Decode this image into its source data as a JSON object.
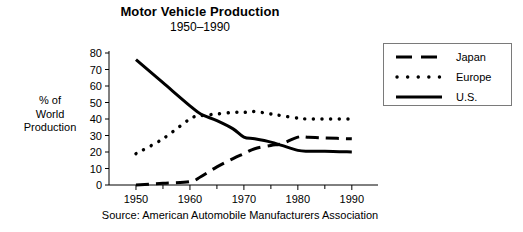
{
  "chart_data": {
    "type": "line",
    "title": "Motor Vehicle Production",
    "subtitle": "1950–1990",
    "xlabel": "",
    "ylabel": "% of World Production",
    "source": "Source: American Automobile Manufacturers Association",
    "xlim": [
      1945,
      1993
    ],
    "ylim": [
      0,
      80
    ],
    "xticks": [
      1950,
      1960,
      1970,
      1980,
      1990
    ],
    "xtick_labels": [
      "1950",
      "1960",
      "1970",
      "1980",
      "1990"
    ],
    "xminor_ticks": [
      1955,
      1965,
      1975,
      1985
    ],
    "yticks": [
      0,
      10,
      20,
      30,
      40,
      50,
      60,
      70,
      80
    ],
    "ytick_labels": [
      "0",
      "10",
      "20",
      "30",
      "40",
      "50",
      "60",
      "70",
      "80"
    ],
    "grid": false,
    "legend_position": "upper right outside",
    "x": [
      1950,
      1955,
      1960,
      1962,
      1965,
      1968,
      1970,
      1972,
      1975,
      1977,
      1980,
      1982,
      1985,
      1990
    ],
    "series": [
      {
        "name": "Japan",
        "style": "dashed",
        "color": "#000000",
        "values": [
          0,
          1,
          2,
          5,
          11,
          16,
          19,
          22,
          24,
          25,
          29,
          29,
          28.5,
          28
        ]
      },
      {
        "name": "Europe",
        "style": "dotted",
        "color": "#000000",
        "values": [
          19,
          28,
          40,
          42,
          43,
          44,
          44,
          44.5,
          43,
          42,
          40.5,
          40,
          40,
          40
        ]
      },
      {
        "name": "U.S.",
        "style": "solid",
        "color": "#000000",
        "values": [
          76,
          62,
          48,
          43,
          39,
          34,
          29,
          28,
          26,
          24,
          21,
          20.5,
          20.5,
          20
        ]
      }
    ]
  },
  "legend": {
    "items": [
      {
        "label": "Japan",
        "style": "dashed"
      },
      {
        "label": "Europe",
        "style": "dotted"
      },
      {
        "label": "U.S.",
        "style": "solid"
      }
    ]
  },
  "axis": {
    "ylabel_lines": [
      "% of",
      "World",
      "Production"
    ]
  }
}
